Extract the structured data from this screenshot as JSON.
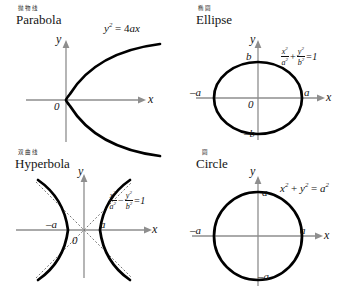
{
  "page": {
    "background": "#ffffff",
    "axis_color": "#8e8e8e",
    "curve_color": "#000000",
    "asymptote_color": "#777777"
  },
  "panels": {
    "parabola": {
      "cn": "抛物线",
      "en": "Parabola",
      "axis_x_label": "x",
      "axis_y_label": "y",
      "origin_label": "0",
      "equation_plain": "y² = 4ax",
      "equation": {
        "lhs_var": "y",
        "lhs_exp": "2",
        "eq": " = 4",
        "coef_a": "a",
        "var_x": "x"
      }
    },
    "ellipse": {
      "cn": "椭圆",
      "en": "Ellipse",
      "axis_x_label": "x",
      "axis_y_label": "y",
      "origin_label": "0",
      "tick_right": "a",
      "tick_left": "–a",
      "tick_top": "b",
      "tick_bottom": "–b",
      "equation_plain": "x²/a² + y²/b² = 1",
      "equation": {
        "num1": "x",
        "num1_exp": "2",
        "den1": "a",
        "den1_exp": "2",
        "operator": "+",
        "num2": "y",
        "num2_exp": "2",
        "den2": "b",
        "den2_exp": "2",
        "rhs": "=1"
      }
    },
    "hyperbola": {
      "cn": "双曲线",
      "en": "Hyperbola",
      "axis_x_label": "x",
      "axis_y_label": "y",
      "origin_label": "0",
      "tick_right": "a",
      "tick_left": "–a",
      "equation_plain": "x²/a² − y²/b² = 1",
      "equation": {
        "num1": "x",
        "num1_exp": "2",
        "den1": "a",
        "den1_exp": "2",
        "operator": "−",
        "num2": "y",
        "num2_exp": "2",
        "den2": "b",
        "den2_exp": "2",
        "rhs": "=1"
      }
    },
    "circle": {
      "cn": "圆",
      "en": "Circle",
      "axis_x_label": "x",
      "axis_y_label": "y",
      "tick_right": "a",
      "tick_left": "–a",
      "tick_top": "a",
      "tick_bottom": "–a",
      "equation_plain": "x² + y² = a²",
      "equation": {
        "var1": "x",
        "var1_exp": "2",
        "plus": " + ",
        "var2": "y",
        "var2_exp": "2",
        "eq": " = ",
        "var3": "a",
        "var3_exp": "2"
      }
    }
  }
}
